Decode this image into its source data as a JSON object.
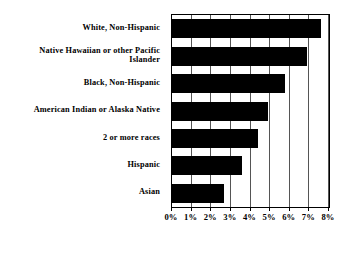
{
  "chart_data": {
    "type": "bar",
    "orientation": "horizontal",
    "title": "",
    "subtitle": "",
    "xlabel": "",
    "ylabel": "",
    "categories": [
      "White, Non-Hispanic",
      "Native Hawaiian or other Pacific Islander",
      "Black, Non-Hispanic",
      "American Indian or Alaska Native",
      "2 or more races",
      "Hispanic",
      "Asian"
    ],
    "category_lines": [
      [
        "White, Non-Hispanic"
      ],
      [
        "Native Hawaiian or other Pacific",
        "Islander"
      ],
      [
        "Black, Non-Hispanic"
      ],
      [
        "American Indian or Alaska Native"
      ],
      [
        "2 or more races"
      ],
      [
        "Hispanic"
      ],
      [
        "Asian"
      ]
    ],
    "values": [
      7.6,
      6.9,
      5.75,
      4.9,
      4.4,
      3.55,
      2.65
    ],
    "xlim": [
      0,
      8
    ],
    "xtick_values": [
      0,
      1,
      2,
      3,
      4,
      5,
      6,
      7,
      8
    ],
    "xtick_labels": [
      "0%",
      "1%",
      "2%",
      "3%",
      "4%",
      "5%",
      "6%",
      "7%",
      "8%"
    ],
    "grid": true,
    "grid_axis": "x",
    "legend": false,
    "bar_color": "#000000",
    "axis_color": "#000000",
    "grid_color": "#555555",
    "background_color": "#ffffff"
  }
}
